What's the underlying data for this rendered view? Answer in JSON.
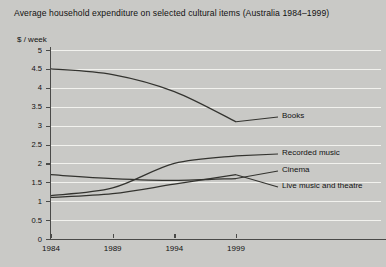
{
  "title": "Average household expenditure on selected cultural items (Australia 1984–1999)",
  "chart_data": {
    "type": "line",
    "title": "Average household expenditure on selected cultural items (Australia 1984–1999)",
    "xlabel": "",
    "ylabel": "$ / week",
    "x": [
      1984,
      1989,
      1994,
      1999
    ],
    "xtick_labels": [
      "1984",
      "1989",
      "1994",
      "1999"
    ],
    "ytick_labels": [
      "5",
      "4.5",
      "4",
      "3.5",
      "3",
      "2.5",
      "2",
      "1.5",
      "1",
      "0.5",
      "0"
    ],
    "ytick_values": [
      5,
      4.5,
      4,
      3.5,
      3,
      2.5,
      2,
      1.5,
      1,
      0.5,
      0
    ],
    "ylim": [
      0,
      5
    ],
    "grid": true,
    "legend_position": "right-inline-labels",
    "series": [
      {
        "name": "Books",
        "values": [
          4.5,
          4.35,
          3.9,
          3.1
        ],
        "label": "Books"
      },
      {
        "name": "Recorded music",
        "values": [
          1.15,
          1.35,
          2.0,
          2.2
        ],
        "label": "Recorded music"
      },
      {
        "name": "Cinema",
        "values": [
          1.7,
          1.6,
          1.55,
          1.6
        ],
        "label": "Cinema"
      },
      {
        "name": "Live music and theatre",
        "values": [
          1.1,
          1.2,
          1.45,
          1.7
        ],
        "label": "Live music and theatre"
      }
    ]
  },
  "axis": {
    "y_label": "$ / week"
  },
  "colors": {
    "background": "#c9c9c6",
    "gridline": "#f2f2ee",
    "axis": "#4a4a48",
    "line": "#33332f",
    "text": "#111111"
  }
}
